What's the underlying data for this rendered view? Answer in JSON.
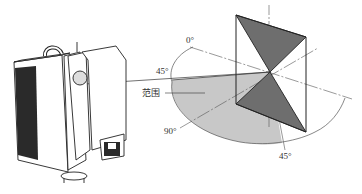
{
  "figure": {
    "labels": {
      "zero_deg": "0°",
      "upper_45_deg": "45°",
      "range": "范围",
      "ninety_deg": "90°",
      "lower_45_deg": "45°"
    },
    "colors": {
      "mirror_dark": "#6e6e6e",
      "range_fill": "#c8c8c8",
      "line": "#333333",
      "scanner_body": "#ffffff",
      "scanner_grille": "#2a2a2a"
    }
  }
}
